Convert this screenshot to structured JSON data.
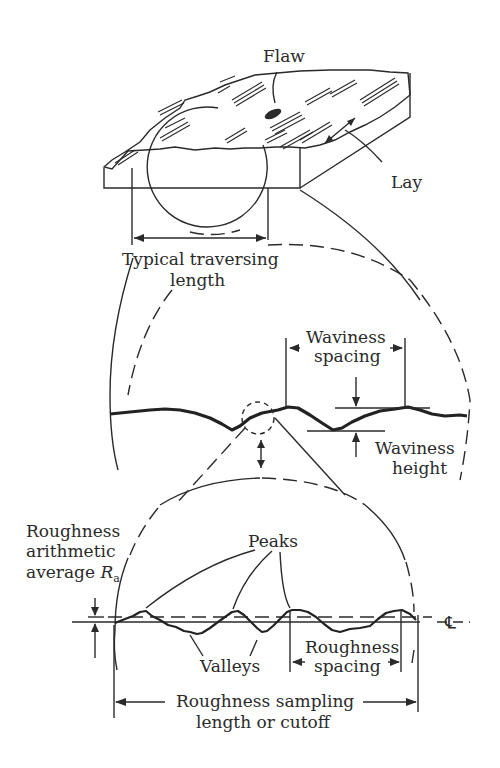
{
  "diagram": {
    "colors": {
      "ink": "#2a2a2a",
      "background": "#ffffff"
    },
    "labels": {
      "flaw": "Flaw",
      "lay": "Lay",
      "traversing_1": "Typical traversing",
      "traversing_2": "length",
      "waviness_spacing_1": "Waviness",
      "waviness_spacing_2": "spacing",
      "waviness_height_1": "Waviness",
      "waviness_height_2": "height",
      "ra_1": "Roughness",
      "ra_2": "arithmetic",
      "ra_3": "average ",
      "ra_symbol": "R",
      "ra_subscript": "a",
      "peaks": "Peaks",
      "valleys": "Valleys",
      "roughness_spacing_1": "Roughness",
      "roughness_spacing_2": "spacing",
      "sampling_1": "Roughness sampling",
      "sampling_2": "length or cutoff",
      "centerline": "℄"
    },
    "sections": [
      "Surface block with flaw and lay",
      "Waviness profile (magnified)",
      "Roughness profile (further magnified)"
    ]
  }
}
